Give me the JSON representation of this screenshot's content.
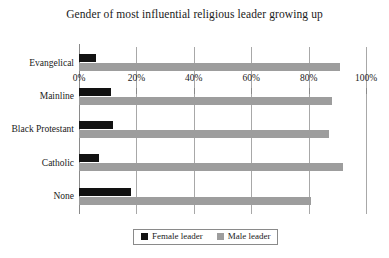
{
  "chart_data": {
    "type": "bar",
    "orientation": "horizontal",
    "title": "Gender of most influential religious leader growing up",
    "xlabel": "",
    "ylabel": "",
    "xlim": [
      0,
      100
    ],
    "xticks": [
      "0%",
      "20%",
      "40%",
      "60%",
      "80%",
      "100%"
    ],
    "xtick_values": [
      0,
      20,
      40,
      60,
      80,
      100
    ],
    "grid": true,
    "categories": [
      "Evangelical",
      "Mainline",
      "Black Protestant",
      "Catholic",
      "None"
    ],
    "series": [
      {
        "name": "Female leader",
        "color": "#121212",
        "values": [
          6,
          11,
          12,
          7,
          18
        ]
      },
      {
        "name": "Male leader",
        "color": "#9d9d9d",
        "values": [
          91,
          88,
          87,
          92,
          81
        ]
      }
    ],
    "legend": {
      "position": "bottom-center",
      "entries": [
        {
          "label": "Female leader",
          "color": "#121212"
        },
        {
          "label": "Male leader",
          "color": "#9d9d9d"
        }
      ]
    }
  }
}
